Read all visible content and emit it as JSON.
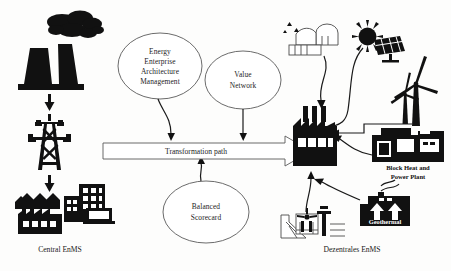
{
  "diagram": {
    "background_color": "#fdfdfc",
    "ink_color": "#111111",
    "left_side": {
      "caption": "Central EnMS",
      "icons": [
        {
          "name": "cooling-towers-with-smoke",
          "label": ""
        },
        {
          "name": "transmission-pylon",
          "label": ""
        },
        {
          "name": "consumers-buildings-factory",
          "label": ""
        }
      ]
    },
    "center": {
      "ellipses": [
        {
          "name": "energy-enterprise-architecture-management",
          "lines": [
            "Energy",
            "Enterprise",
            "Architecture",
            "Management"
          ]
        },
        {
          "name": "value-network",
          "lines": [
            "Value",
            "Network"
          ]
        },
        {
          "name": "balanced-scorecard",
          "lines": [
            "Balanced",
            "Scorecard"
          ]
        }
      ],
      "arrow_label": "Transformation path"
    },
    "right_side": {
      "caption": "Dezentrales EnMS",
      "icons": [
        {
          "name": "biogas-plant",
          "label": ""
        },
        {
          "name": "solar-panel-with-sun",
          "label": ""
        },
        {
          "name": "wind-turbines",
          "label": ""
        },
        {
          "name": "block-heat-and-power-plant",
          "label": "Block Heat and\nPower Plant"
        },
        {
          "name": "block-heat-power-plant-line1",
          "label": "Block Heat and"
        },
        {
          "name": "block-heat-power-plant-line2",
          "label": "Power Plant"
        },
        {
          "name": "geothermal-plant",
          "label": "Geothermal"
        },
        {
          "name": "hydro-power-plant",
          "label": ""
        },
        {
          "name": "decentral-factory",
          "label": ""
        }
      ]
    }
  }
}
